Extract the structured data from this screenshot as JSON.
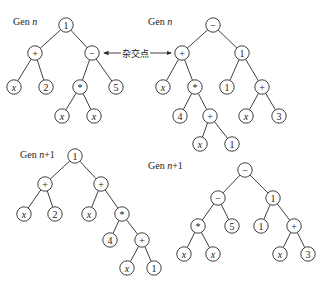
{
  "crossover_label": "杂交点",
  "colors": {
    "line": "#2a2a2a",
    "text": "#222222",
    "background": "#ffffff"
  },
  "trees": [
    {
      "id": "gen-n-left",
      "label_prefix": "Gen ",
      "label_var": "n",
      "label_suffix": "",
      "label_pos": [
        13,
        16
      ],
      "nodes": [
        {
          "id": "a0",
          "text": "1",
          "x": 66,
          "y": 25
        },
        {
          "id": "a1",
          "text": "+",
          "x": 35,
          "y": 53,
          "parent": "a0"
        },
        {
          "id": "a2",
          "text": "−",
          "x": 92,
          "y": 53,
          "parent": "a0",
          "crossover": true
        },
        {
          "id": "a3",
          "text": "x",
          "x": 14,
          "y": 87,
          "parent": "a1",
          "var": true
        },
        {
          "id": "a4",
          "text": "2",
          "x": 46,
          "y": 87,
          "parent": "a1"
        },
        {
          "id": "a5",
          "text": "*",
          "x": 80,
          "y": 87,
          "parent": "a2"
        },
        {
          "id": "a6",
          "text": "5",
          "x": 116,
          "y": 87,
          "parent": "a2"
        },
        {
          "id": "a7",
          "text": "x",
          "x": 62,
          "y": 116,
          "parent": "a5",
          "var": true
        },
        {
          "id": "a8",
          "text": "x",
          "x": 94,
          "y": 116,
          "parent": "a5",
          "var": true
        }
      ]
    },
    {
      "id": "gen-n-right",
      "label_prefix": "Gen ",
      "label_var": "n",
      "label_suffix": "",
      "label_pos": [
        148,
        16
      ],
      "nodes": [
        {
          "id": "b0",
          "text": "−",
          "x": 213,
          "y": 25
        },
        {
          "id": "b1",
          "text": "+",
          "x": 182,
          "y": 53,
          "parent": "b0",
          "crossover": true
        },
        {
          "id": "b2",
          "text": "1",
          "x": 242,
          "y": 53,
          "parent": "b0"
        },
        {
          "id": "b3",
          "text": "x",
          "x": 163,
          "y": 87,
          "parent": "b1",
          "var": true
        },
        {
          "id": "b4",
          "text": "*",
          "x": 195,
          "y": 87,
          "parent": "b1"
        },
        {
          "id": "b5",
          "text": "1",
          "x": 227,
          "y": 87,
          "parent": "b2"
        },
        {
          "id": "b6",
          "text": "+",
          "x": 262,
          "y": 87,
          "parent": "b2"
        },
        {
          "id": "b7",
          "text": "4",
          "x": 180,
          "y": 116,
          "parent": "b4"
        },
        {
          "id": "b8",
          "text": "+",
          "x": 210,
          "y": 116,
          "parent": "b4"
        },
        {
          "id": "b9",
          "text": "x",
          "x": 246,
          "y": 116,
          "parent": "b6",
          "var": true
        },
        {
          "id": "b10",
          "text": "3",
          "x": 279,
          "y": 116,
          "parent": "b6"
        },
        {
          "id": "b11",
          "text": "x",
          "x": 200,
          "y": 144,
          "parent": "b8",
          "var": true
        },
        {
          "id": "b12",
          "text": "1",
          "x": 232,
          "y": 144,
          "parent": "b8"
        }
      ]
    },
    {
      "id": "gen-n1-left",
      "label_prefix": "Gen ",
      "label_var": "n",
      "label_suffix": "+1",
      "label_pos": [
        20,
        149
      ],
      "nodes": [
        {
          "id": "c0",
          "text": "1",
          "x": 75,
          "y": 156
        },
        {
          "id": "c1",
          "text": "+",
          "x": 45,
          "y": 184,
          "parent": "c0"
        },
        {
          "id": "c2",
          "text": "+",
          "x": 101,
          "y": 184,
          "parent": "c0"
        },
        {
          "id": "c3",
          "text": "x",
          "x": 24,
          "y": 214,
          "parent": "c1",
          "var": true
        },
        {
          "id": "c4",
          "text": "2",
          "x": 55,
          "y": 214,
          "parent": "c1"
        },
        {
          "id": "c5",
          "text": "x",
          "x": 89,
          "y": 214,
          "parent": "c2",
          "var": true
        },
        {
          "id": "c6",
          "text": "*",
          "x": 122,
          "y": 214,
          "parent": "c2"
        },
        {
          "id": "c7",
          "text": "4",
          "x": 110,
          "y": 240,
          "parent": "c6"
        },
        {
          "id": "c8",
          "text": "+",
          "x": 142,
          "y": 240,
          "parent": "c6"
        },
        {
          "id": "c9",
          "text": "x",
          "x": 127,
          "y": 268,
          "parent": "c8",
          "var": true
        },
        {
          "id": "c10",
          "text": "1",
          "x": 154,
          "y": 268,
          "parent": "c8"
        }
      ]
    },
    {
      "id": "gen-n1-right",
      "label_prefix": "Gen ",
      "label_var": "n",
      "label_suffix": "+1",
      "label_pos": [
        148,
        160
      ],
      "nodes": [
        {
          "id": "d0",
          "text": "−",
          "x": 245,
          "y": 170
        },
        {
          "id": "d1",
          "text": "−",
          "x": 218,
          "y": 198,
          "parent": "d0"
        },
        {
          "id": "d2",
          "text": "1",
          "x": 273,
          "y": 198,
          "parent": "d0"
        },
        {
          "id": "d3",
          "text": "*",
          "x": 198,
          "y": 226,
          "parent": "d1"
        },
        {
          "id": "d4",
          "text": "5",
          "x": 232,
          "y": 226,
          "parent": "d1"
        },
        {
          "id": "d5",
          "text": "1",
          "x": 261,
          "y": 226,
          "parent": "d2"
        },
        {
          "id": "d6",
          "text": "+",
          "x": 294,
          "y": 226,
          "parent": "d2"
        },
        {
          "id": "d7",
          "text": "x",
          "x": 184,
          "y": 254,
          "parent": "d3",
          "var": true
        },
        {
          "id": "d8",
          "text": "x",
          "x": 213,
          "y": 254,
          "parent": "d3",
          "var": true
        },
        {
          "id": "d9",
          "text": "x",
          "x": 280,
          "y": 254,
          "parent": "d6",
          "var": true
        },
        {
          "id": "d10",
          "text": "3",
          "x": 308,
          "y": 254,
          "parent": "d6"
        }
      ]
    }
  ],
  "crossover_arrow": {
    "from": [
      104,
      53
    ],
    "to": [
      171,
      53
    ],
    "label_x": 121,
    "label_y": 47
  }
}
